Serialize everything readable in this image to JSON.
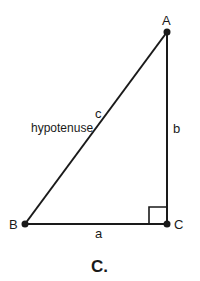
{
  "diagram": {
    "type": "right-triangle",
    "vertices": [
      {
        "id": "A",
        "label": "A",
        "x": 167,
        "y": 32
      },
      {
        "id": "B",
        "label": "B",
        "x": 25,
        "y": 224
      },
      {
        "id": "C",
        "label": "C",
        "x": 167,
        "y": 224
      }
    ],
    "sides": {
      "a": "a",
      "b": "b",
      "c": "c",
      "hypotenuse_label": "hypotenuse"
    },
    "right_angle_at": "C",
    "caption": "C."
  }
}
